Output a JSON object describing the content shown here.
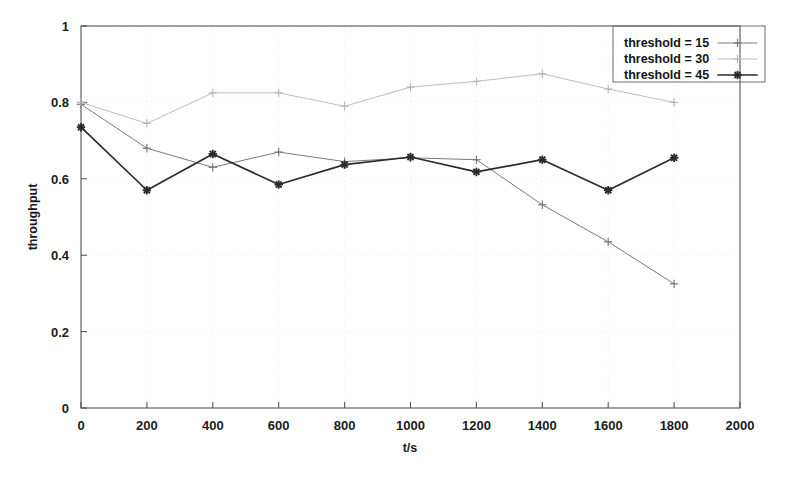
{
  "chart_data": {
    "type": "line",
    "title": "",
    "xlabel": "t/s",
    "ylabel": "throughput",
    "xlim": [
      0,
      2000
    ],
    "ylim": [
      0,
      1
    ],
    "xticks": [
      0,
      200,
      400,
      600,
      800,
      1000,
      1200,
      1400,
      1600,
      1800,
      2000
    ],
    "xtick_labels": [
      "0",
      "200",
      "400",
      "600",
      "800",
      "1000",
      "1200",
      "1400",
      "1600",
      "1800",
      "2000"
    ],
    "yticks": [
      0,
      0.2,
      0.4,
      0.6,
      0.8,
      1
    ],
    "ytick_labels": [
      "0",
      "0.2",
      "0.4",
      "0.6",
      "0.8",
      "1"
    ],
    "grid": true,
    "legend_position": "top-right",
    "x": [
      0,
      200,
      400,
      600,
      800,
      1000,
      1200,
      1400,
      1600,
      1800
    ],
    "series": [
      {
        "name": "threshold = 15",
        "color": "#7a7a7a",
        "marker": "plus",
        "line_width": 1.0,
        "values": [
          0.795,
          0.68,
          0.63,
          0.67,
          0.645,
          0.655,
          0.65,
          0.532,
          0.435,
          0.325
        ]
      },
      {
        "name": "threshold = 30",
        "color": "#b4b4b4",
        "marker": "plus",
        "line_width": 0.9,
        "values": [
          0.8,
          0.745,
          0.825,
          0.825,
          0.79,
          0.84,
          0.855,
          0.875,
          0.835,
          0.8
        ]
      },
      {
        "name": "threshold = 45",
        "color": "#2b2b2b",
        "marker": "star",
        "line_width": 1.7,
        "values": [
          0.735,
          0.57,
          0.665,
          0.585,
          0.637,
          0.657,
          0.618,
          0.65,
          0.57,
          0.655
        ]
      }
    ]
  },
  "legend": {
    "entries": [
      {
        "label": "threshold = 15"
      },
      {
        "label": "threshold = 30"
      },
      {
        "label": "threshold = 45"
      }
    ]
  },
  "axes": {
    "x_title": "t/s",
    "y_title": "throughput"
  }
}
